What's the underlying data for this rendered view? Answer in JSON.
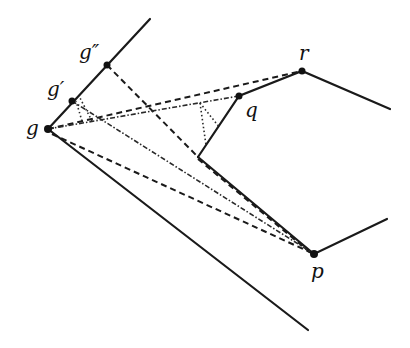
{
  "diagram": {
    "title": "",
    "labels": {
      "g": "g",
      "g_prime": "g′",
      "g_double_prime": "g″",
      "q": "q",
      "r": "r",
      "p": "p"
    },
    "points": {
      "g": [
        48,
        129
      ],
      "g_prime": [
        72,
        101
      ],
      "g_double_prime": [
        107,
        65
      ],
      "q": [
        239,
        96
      ],
      "r": [
        302,
        71
      ],
      "p": [
        314,
        254
      ],
      "reflex": [
        198,
        157
      ]
    },
    "edges": {
      "upper_ray": [
        [
          48,
          129
        ],
        [
          150,
          19
        ]
      ],
      "lower_ray": [
        [
          48,
          129
        ],
        [
          308,
          330
        ]
      ],
      "polygon_chain": [
        [
          198,
          157
        ],
        [
          239,
          96
        ],
        [
          302,
          71
        ],
        [
          390,
          109
        ]
      ],
      "p_chain": [
        [
          198,
          157
        ],
        [
          314,
          254
        ],
        [
          387,
          219
        ]
      ]
    },
    "line_styles": {
      "solid": "polygon boundary",
      "dashed": "visibility segments",
      "dash_dot": "visibility segments from g/g′",
      "dotted": "perpendicular drops"
    }
  }
}
